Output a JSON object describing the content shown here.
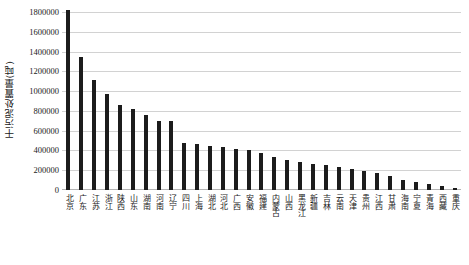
{
  "chart_data": {
    "type": "bar",
    "title": "",
    "xlabel": "",
    "ylabel": "干污泥处置量(吨)",
    "ylim": [
      0,
      1800000
    ],
    "ytick_labels": [
      "1800000",
      "1600000",
      "1400000",
      "1200000",
      "1000000",
      "800000",
      "600000",
      "400000",
      "200000",
      "0"
    ],
    "ytick_values": [
      1800000,
      1600000,
      1400000,
      1200000,
      1000000,
      800000,
      600000,
      400000,
      200000,
      0
    ],
    "grid": true,
    "legend": "none",
    "categories": [
      "北京",
      "广东",
      "江苏",
      "浙江",
      "陕西",
      "山东",
      "湖南",
      "河南",
      "辽宁",
      "四川",
      "上海",
      "湖北",
      "河北",
      "广西",
      "安徽",
      "福建",
      "内蒙古",
      "山西",
      "黑龙江",
      "新疆",
      "吉林",
      "云南",
      "天津",
      "贵州",
      "江西",
      "甘肃",
      "海南",
      "宁夏",
      "青海",
      "西藏",
      "重庆"
    ],
    "values": [
      1820000,
      1350000,
      1115000,
      975000,
      855000,
      820000,
      760000,
      700000,
      695000,
      480000,
      465000,
      450000,
      435000,
      410000,
      400000,
      370000,
      330000,
      300000,
      285000,
      265000,
      250000,
      230000,
      215000,
      195000,
      170000,
      140000,
      105000,
      78000,
      62000,
      45000,
      16000
    ]
  }
}
